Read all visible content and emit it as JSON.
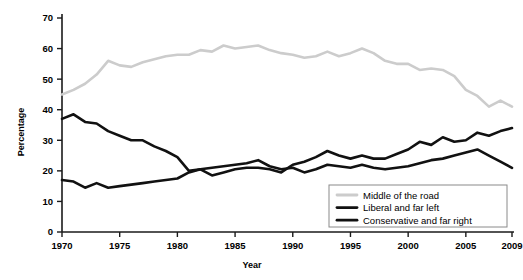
{
  "chart_data": {
    "type": "line",
    "title": "",
    "xlabel": "Year",
    "ylabel": "Percentage",
    "xlim": [
      1970,
      2009
    ],
    "ylim": [
      0,
      70
    ],
    "ytick_values": [
      0,
      10,
      20,
      30,
      40,
      50,
      60,
      70
    ],
    "ytick_labels": [
      "0",
      "10",
      "20",
      "30",
      "40",
      "50",
      "60",
      "70"
    ],
    "xtick_values": [
      1970,
      1975,
      1980,
      1985,
      1990,
      1995,
      2000,
      2005,
      2009
    ],
    "xtick_labels": [
      "1970",
      "1975",
      "1980",
      "1985",
      "1990",
      "1995",
      "2000",
      "2005",
      "2009"
    ],
    "grid": false,
    "legend_position": "bottom-right",
    "x": [
      1970,
      1971,
      1972,
      1973,
      1974,
      1975,
      1976,
      1977,
      1978,
      1979,
      1980,
      1981,
      1982,
      1983,
      1984,
      1985,
      1986,
      1987,
      1988,
      1989,
      1990,
      1991,
      1992,
      1993,
      1994,
      1995,
      1996,
      1997,
      1998,
      1999,
      2000,
      2001,
      2002,
      2003,
      2004,
      2005,
      2006,
      2007,
      2008,
      2009
    ],
    "series": [
      {
        "name": "Middle of the road",
        "color": "#cccccc",
        "width": 2.6,
        "values": [
          45.0,
          46.5,
          48.5,
          51.5,
          56.0,
          54.5,
          54.0,
          55.5,
          56.5,
          57.5,
          58.0,
          58.0,
          59.5,
          59.0,
          61.0,
          60.0,
          60.5,
          61.0,
          59.5,
          58.5,
          58.0,
          57.0,
          57.5,
          59.0,
          57.5,
          58.5,
          60.0,
          58.5,
          56.0,
          55.0,
          55.0,
          53.0,
          53.5,
          53.0,
          51.0,
          46.5,
          44.5,
          41.0,
          43.0,
          41.0
        ]
      },
      {
        "name": "Liberal and far left",
        "color": "#111111",
        "width": 2.6,
        "values": [
          37.0,
          38.5,
          36.0,
          35.5,
          33.0,
          31.5,
          30.0,
          30.0,
          28.0,
          26.5,
          24.5,
          20.0,
          20.5,
          18.5,
          19.5,
          20.5,
          21.0,
          21.0,
          20.5,
          19.5,
          22.0,
          23.0,
          24.5,
          26.5,
          25.0,
          24.0,
          25.0,
          24.0,
          24.0,
          25.5,
          27.0,
          29.5,
          28.5,
          31.0,
          29.5,
          30.0,
          32.5,
          31.5,
          33.0,
          34.0
        ]
      },
      {
        "name": "Conservative and far right",
        "color": "#111111",
        "width": 2.6,
        "values": [
          17.0,
          16.5,
          14.5,
          16.0,
          14.5,
          15.0,
          15.5,
          16.0,
          16.5,
          17.0,
          17.5,
          19.5,
          20.5,
          21.0,
          21.5,
          22.0,
          22.5,
          23.5,
          21.5,
          20.5,
          21.0,
          19.5,
          20.5,
          22.0,
          21.5,
          21.0,
          22.0,
          21.0,
          20.5,
          21.0,
          21.5,
          22.5,
          23.5,
          24.0,
          25.0,
          26.0,
          27.0,
          25.0,
          23.0,
          21.0
        ]
      }
    ]
  },
  "legend": {
    "items": [
      {
        "label": "Middle of the road",
        "color": "#cccccc"
      },
      {
        "label": "Liberal and far left",
        "color": "#111111"
      },
      {
        "label": "Conservative and far right",
        "color": "#111111"
      }
    ]
  },
  "axis_titles": {
    "y": "Percentage",
    "x": "Year"
  }
}
